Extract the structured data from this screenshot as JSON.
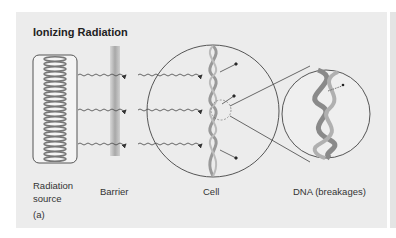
{
  "figure": {
    "title": "Ionizing Radiation",
    "panel_label": "(a)",
    "labels": {
      "source_line1": "Radiation",
      "source_line2": "source",
      "barrier": "Barrier",
      "cell": "Cell",
      "dna": "DNA (breakages)"
    },
    "colors": {
      "panel_bg": "#ececec",
      "line": "#444444",
      "barrier": "#b8b8b8",
      "dna": "#9a9a9a"
    }
  }
}
